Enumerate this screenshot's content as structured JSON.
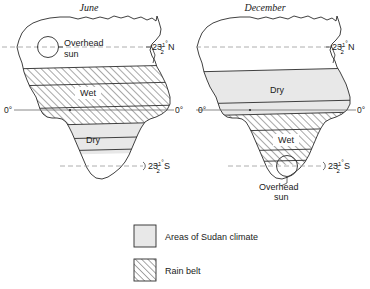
{
  "figure": {
    "background_color": "#ffffff",
    "line_color": "#2b2b2b",
    "sudan_fill_color": "#e8e8e8",
    "rainbelt_hatch_color": "#6e6e6e",
    "dashed_line_color": "#9a9a9a"
  },
  "maps": [
    {
      "id": "june",
      "title": "June",
      "zone_labels": [
        {
          "name": "rain-belt-label",
          "text": "Wet"
        },
        {
          "name": "sudan-zone-label",
          "text": "Dry"
        }
      ],
      "overhead_sun": {
        "line1": "Overhead",
        "line2": "sun",
        "at_latitude": "23½°N"
      },
      "latitude_labels": [
        {
          "name": "tropic-of-cancer-label",
          "value": "23",
          "fraction_num": "1",
          "fraction_den": "2",
          "degree": "°",
          "hemisphere": "N"
        },
        {
          "name": "tropic-of-capricorn-label",
          "value": "23",
          "fraction_num": "1",
          "fraction_den": "2",
          "degree": "°",
          "hemisphere": "S"
        }
      ],
      "equator_labels": [
        "0°",
        "0°"
      ]
    },
    {
      "id": "december",
      "title": "December",
      "zone_labels": [
        {
          "name": "sudan-zone-label",
          "text": "Dry"
        },
        {
          "name": "rain-belt-label",
          "text": "Wet"
        }
      ],
      "overhead_sun": {
        "line1": "Overhead",
        "line2": "sun",
        "at_latitude": "23½°S"
      },
      "latitude_labels": [
        {
          "name": "tropic-of-cancer-label",
          "value": "23",
          "fraction_num": "1",
          "fraction_den": "2",
          "degree": "°",
          "hemisphere": "N"
        },
        {
          "name": "tropic-of-capricorn-label",
          "value": "23",
          "fraction_num": "1",
          "fraction_den": "2",
          "degree": "°",
          "hemisphere": "S"
        }
      ],
      "equator_labels": [
        "0°",
        "0°"
      ]
    }
  ],
  "legend": {
    "items": [
      {
        "name": "legend-sudan-climate",
        "swatch": "solid-light-fill",
        "label": "Areas of Sudan climate"
      },
      {
        "name": "legend-rain-belt",
        "swatch": "diagonal-hatch-fill",
        "label": "Rain belt"
      }
    ]
  }
}
